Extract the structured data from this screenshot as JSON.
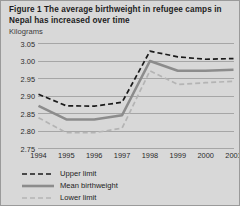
{
  "figure": {
    "title": "Figure 1  The average birthweight in refugee camps in Nepal has increased over time",
    "unit_label": "Kilograms",
    "background_color": "#d8d8d8",
    "border_color": "#9a9a9a"
  },
  "legend": {
    "position": "bottom-left",
    "items": [
      {
        "label": "Upper limit",
        "style": "dashed",
        "color": "#1a1a1a"
      },
      {
        "label": "Mean birthweight",
        "style": "solid",
        "color": "#8c8c8c"
      },
      {
        "label": "Lower limit",
        "style": "dashed",
        "color": "#b4b4b4"
      }
    ]
  },
  "chart_data": {
    "type": "line",
    "title": "Figure 1  The average birthweight in refugee camps in Nepal has increased over time",
    "xlabel": "",
    "ylabel": "Kilograms",
    "x": [
      1994,
      1995,
      1996,
      1997,
      1998,
      1999,
      2000,
      2001
    ],
    "categories": [
      "1994",
      "1995",
      "1996",
      "1997",
      "1998",
      "1999",
      "2000",
      "2001"
    ],
    "ylim": [
      2.75,
      3.05
    ],
    "yticks": [
      2.75,
      2.8,
      2.85,
      2.9,
      2.95,
      3.0,
      3.05
    ],
    "ytick_labels": [
      "2.75",
      "2.80",
      "2.85",
      "2.90",
      "2.95",
      "3.00",
      "3.05"
    ],
    "grid": true,
    "legend_position": "bottom-left",
    "series": [
      {
        "name": "Upper limit",
        "style": "dashed",
        "color": "#1a1a1a",
        "values": [
          2.905,
          2.872,
          2.871,
          2.882,
          3.028,
          3.012,
          3.005,
          3.007
        ]
      },
      {
        "name": "Mean birthweight",
        "style": "solid",
        "color": "#8c8c8c",
        "values": [
          2.872,
          2.833,
          2.833,
          2.845,
          3.0,
          2.972,
          2.972,
          2.975
        ]
      },
      {
        "name": "Lower limit",
        "style": "dashed",
        "color": "#b4b4b4",
        "values": [
          2.838,
          2.795,
          2.795,
          2.808,
          2.972,
          2.933,
          2.938,
          2.942
        ]
      }
    ]
  }
}
